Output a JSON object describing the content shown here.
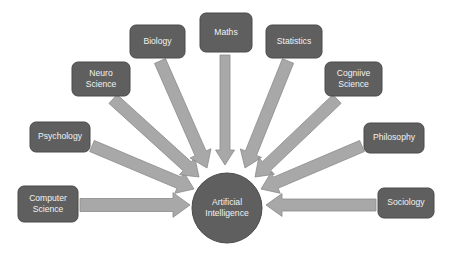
{
  "diagram": {
    "type": "radial-convergence",
    "canvas": {
      "width": 454,
      "height": 254,
      "background": "#ffffff"
    },
    "colors": {
      "node_fill": "#5f5f5f",
      "node_stroke": "#4a4a4a",
      "node_text": "#f2f2f2",
      "hub_fill": "#5f5f5f",
      "hub_stroke": "#4a4a4a",
      "hub_text": "#f2f2f2",
      "arrow_fill": "#a8a8a8",
      "arrow_stroke": "#8a8a8a"
    },
    "hub": {
      "name": "artificial-intelligence",
      "line1": "Artificial",
      "line2": "Intelligence",
      "cx": 227,
      "cy": 208,
      "r": 35
    },
    "nodes": [
      {
        "id": "computer-science",
        "line1": "Computer",
        "line2": "Science",
        "x": 18,
        "y": 186,
        "w": 60,
        "h": 36,
        "arrow": {
          "x1": 80,
          "y1": 205,
          "x2": 190,
          "y2": 205,
          "width": 13,
          "head": 17
        }
      },
      {
        "id": "psychology",
        "line1": "Psychology",
        "line2": "",
        "x": 30,
        "y": 122,
        "w": 60,
        "h": 30,
        "arrow": {
          "x1": 92,
          "y1": 146,
          "x2": 194,
          "y2": 189,
          "width": 12,
          "head": 16
        }
      },
      {
        "id": "neuro-science",
        "line1": "Neuro",
        "line2": "Science",
        "x": 72,
        "y": 62,
        "w": 58,
        "h": 34,
        "arrow": {
          "x1": 113,
          "y1": 99,
          "x2": 199,
          "y2": 177,
          "width": 12,
          "head": 16
        }
      },
      {
        "id": "biology",
        "line1": "Biology",
        "line2": "",
        "x": 130,
        "y": 25,
        "w": 55,
        "h": 33,
        "arrow": {
          "x1": 160,
          "y1": 61,
          "x2": 207,
          "y2": 168,
          "width": 12,
          "head": 16
        }
      },
      {
        "id": "maths",
        "line1": "Maths",
        "line2": "",
        "x": 200,
        "y": 13,
        "w": 52,
        "h": 39,
        "arrow": {
          "x1": 225,
          "y1": 55,
          "x2": 225,
          "y2": 165,
          "width": 10,
          "head": 15
        }
      },
      {
        "id": "statistics",
        "line1": "Statistics",
        "line2": "",
        "x": 266,
        "y": 25,
        "w": 56,
        "h": 33,
        "arrow": {
          "x1": 288,
          "y1": 61,
          "x2": 245,
          "y2": 168,
          "width": 12,
          "head": 16
        }
      },
      {
        "id": "cogniive-science",
        "line1": "Cogniive",
        "line2": "Science",
        "x": 325,
        "y": 62,
        "w": 57,
        "h": 34,
        "arrow": {
          "x1": 337,
          "y1": 99,
          "x2": 255,
          "y2": 177,
          "width": 12,
          "head": 16
        }
      },
      {
        "id": "philosophy",
        "line1": "Philosophy",
        "line2": "",
        "x": 364,
        "y": 123,
        "w": 60,
        "h": 30,
        "arrow": {
          "x1": 362,
          "y1": 146,
          "x2": 261,
          "y2": 189,
          "width": 12,
          "head": 16
        }
      },
      {
        "id": "sociology",
        "line1": "Sociology",
        "line2": "",
        "x": 378,
        "y": 188,
        "w": 56,
        "h": 30,
        "arrow": {
          "x1": 376,
          "y1": 205,
          "x2": 266,
          "y2": 205,
          "width": 12,
          "head": 16
        }
      }
    ]
  }
}
